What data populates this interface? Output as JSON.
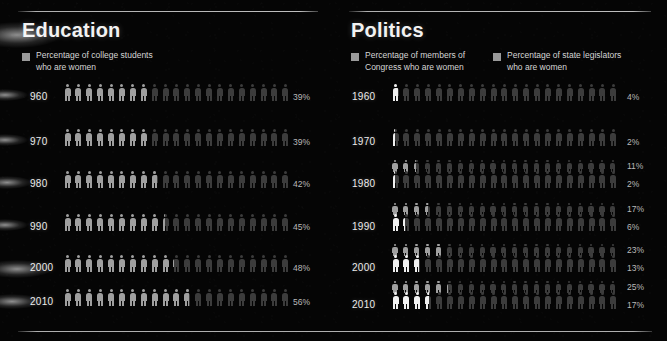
{
  "meta": {
    "background_color": "#050505",
    "dim_figure_color": "#3c3c3c",
    "lit_figure_color": "#f0f0f0",
    "mid_figure_color": "#9f9f9f",
    "figures_per_row": 21
  },
  "education": {
    "title": "Education",
    "legend": [
      {
        "swatch_color": "#9a9a9a",
        "label": "Percentage of college students\nwho are women"
      }
    ],
    "rows": [
      {
        "year": "1960",
        "year_display": "960",
        "percent": "39%",
        "value": 39
      },
      {
        "year": "1970",
        "year_display": "970",
        "percent": "39%",
        "value": 39
      },
      {
        "year": "1980",
        "year_display": "980",
        "percent": "42%",
        "value": 42
      },
      {
        "year": "1990",
        "year_display": "990",
        "percent": "45%",
        "value": 45
      },
      {
        "year": "2000",
        "year_display": "2000",
        "percent": "48%",
        "value": 48
      },
      {
        "year": "2010",
        "year_display": "2010",
        "percent": "56%",
        "value": 56
      }
    ]
  },
  "politics": {
    "title": "Politics",
    "legend": [
      {
        "swatch_color": "#9a9a9a",
        "label": "Percentage of members of\nCongress who are women"
      },
      {
        "swatch_color": "#9a9a9a",
        "label": "Percentage of state legislators\nwho are women"
      }
    ],
    "rows": [
      {
        "year": "1960",
        "legislators_percent": "",
        "legislators_value": null,
        "congress_percent": "4%",
        "congress_value": 4
      },
      {
        "year": "1970",
        "legislators_percent": "",
        "legislators_value": null,
        "congress_percent": "2%",
        "congress_value": 2
      },
      {
        "year": "1980",
        "legislators_percent": "11%",
        "legislators_value": 11,
        "congress_percent": "2%",
        "congress_value": 2
      },
      {
        "year": "1990",
        "legislators_percent": "17%",
        "legislators_value": 17,
        "congress_percent": "6%",
        "congress_value": 6
      },
      {
        "year": "2000",
        "legislators_percent": "23%",
        "legislators_value": 23,
        "congress_percent": "13%",
        "congress_value": 13
      },
      {
        "year": "2010",
        "legislators_percent": "25%",
        "legislators_value": 25,
        "congress_percent": "17%",
        "congress_value": 17
      }
    ]
  },
  "chart_data": {
    "type": "bar",
    "subtitle": "Pictogram rows: each row = 21 human icons representing 100%",
    "xlabel": "",
    "ylabel": "",
    "categories": [
      "1960",
      "1970",
      "1980",
      "1990",
      "2000",
      "2010"
    ],
    "ylim": [
      0,
      100
    ],
    "grid": false,
    "legend_position": "top",
    "series": [
      {
        "name": "Percentage of college students who are women",
        "panel": "Education",
        "values": [
          39,
          39,
          42,
          45,
          48,
          56
        ]
      },
      {
        "name": "Percentage of state legislators who are women",
        "panel": "Politics",
        "values": [
          null,
          null,
          11,
          17,
          23,
          25
        ]
      },
      {
        "name": "Percentage of members of Congress who are women",
        "panel": "Politics",
        "values": [
          4,
          2,
          2,
          6,
          13,
          17
        ]
      }
    ]
  }
}
